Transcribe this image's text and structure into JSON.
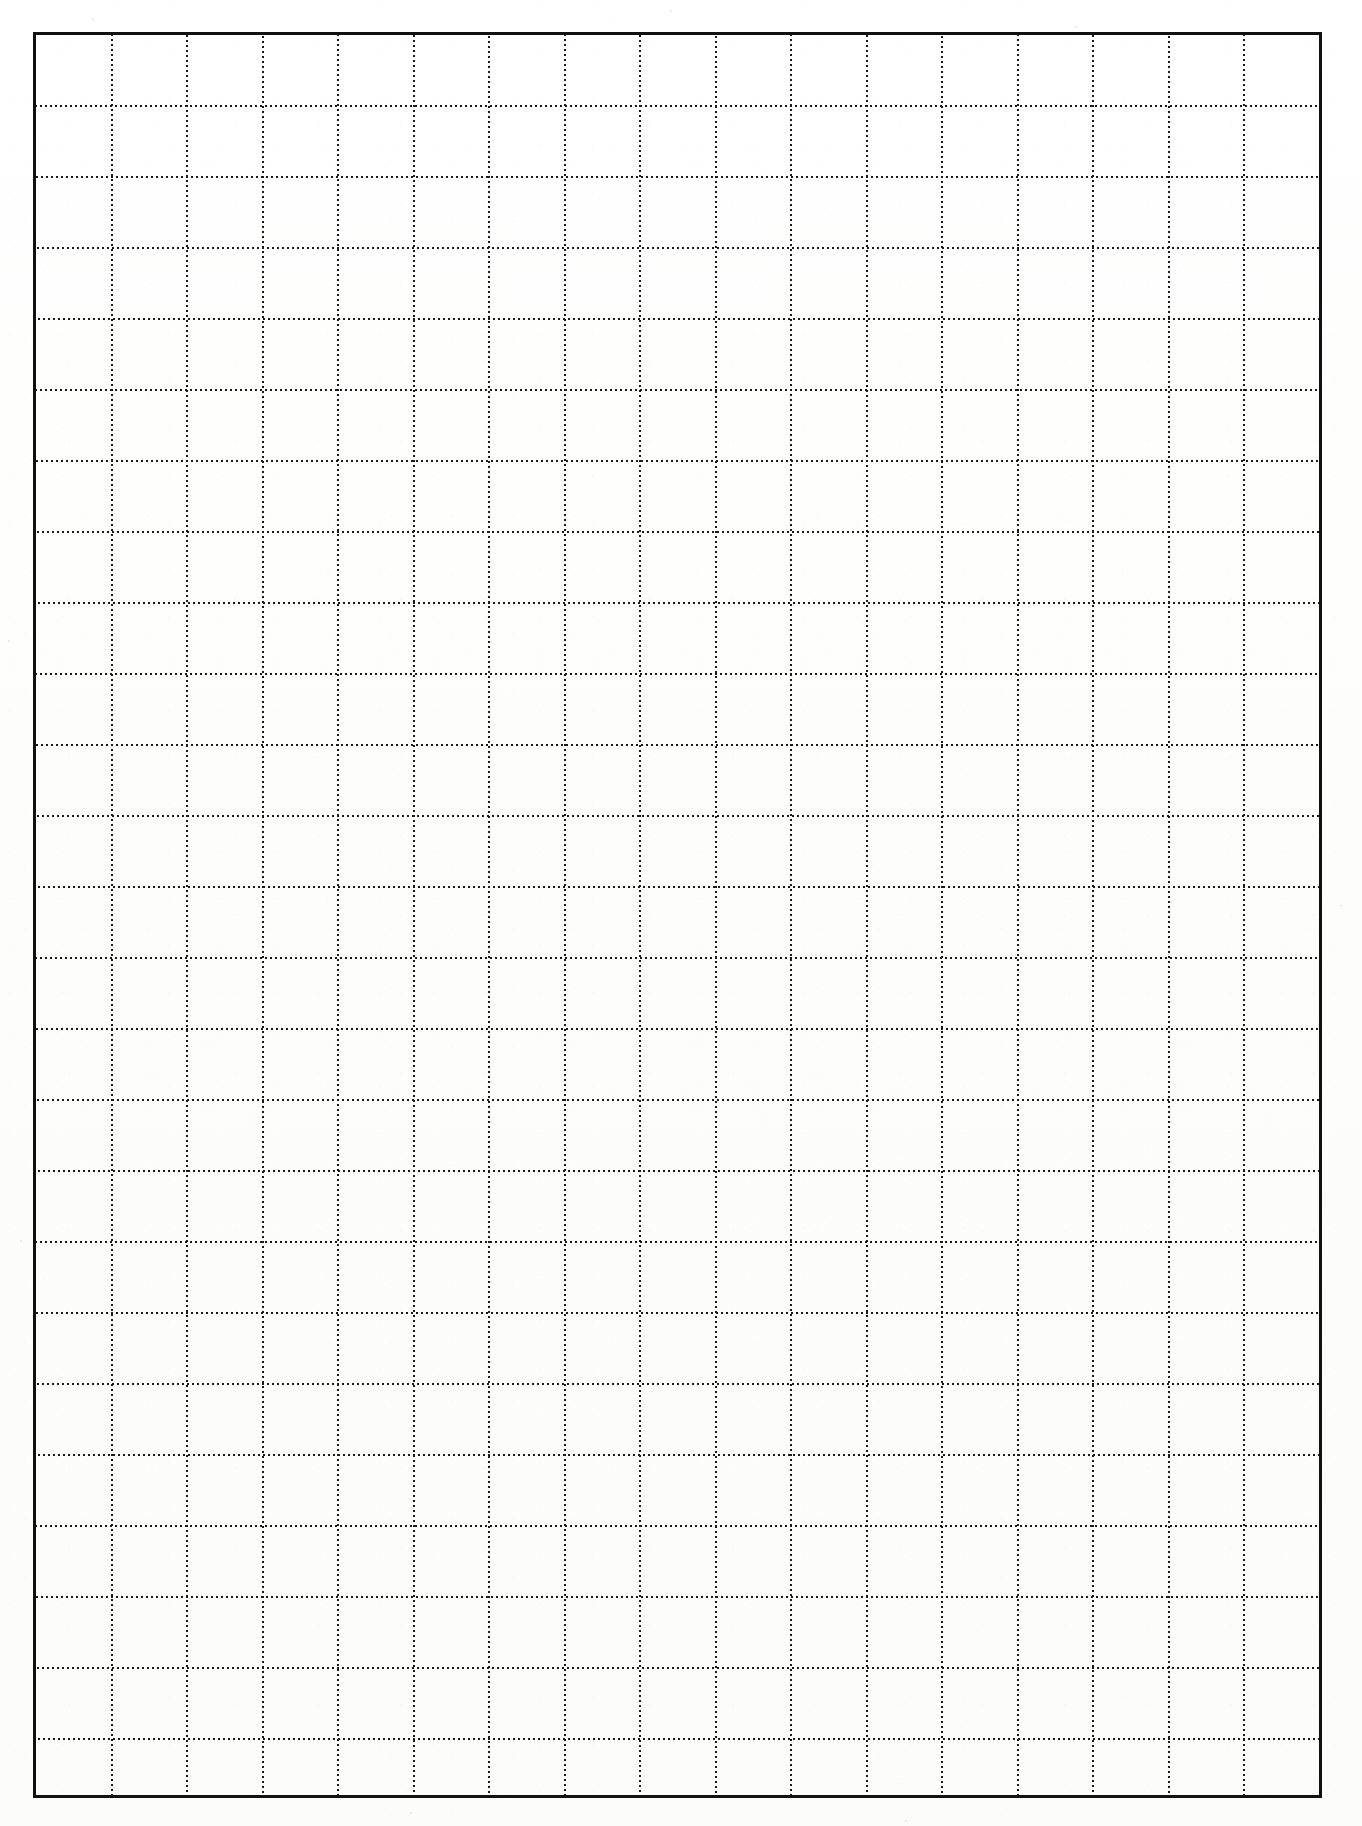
{
  "document": {
    "kind": "scanned-graph-paper",
    "page_width": 1362,
    "page_height": 1826,
    "background_color": "#fdfdfc",
    "caption": ""
  },
  "frame": {
    "name": "plot-border",
    "color": "#111111",
    "thickness_px": 3,
    "left": 33,
    "top": 32,
    "width": 1289,
    "height": 1766
  },
  "grid": {
    "style": "dotted",
    "dot_color": "#1a1a1a",
    "dot_size_px": 2,
    "dot_period_px": 5,
    "columns": 17,
    "rows": 25,
    "cell_width_px": 75.5,
    "cell_height_px": 71,
    "vertical_line_x": [
      75.5,
      151,
      226.5,
      302,
      377.5,
      453,
      528.5,
      604,
      679.5,
      755,
      830.5,
      906,
      981.5,
      1057,
      1132.5,
      1208
    ],
    "horizontal_line_y": [
      71,
      142,
      213,
      284,
      355,
      426,
      497,
      568,
      639,
      710,
      781,
      852,
      923,
      994,
      1065,
      1136,
      1207,
      1278,
      1349,
      1420,
      1491,
      1562,
      1633,
      1704
    ]
  },
  "specks": [
    {
      "x": 92,
      "y": 18,
      "r": 2
    },
    {
      "x": 670,
      "y": 10,
      "r": 2
    },
    {
      "x": 1075,
      "y": 26,
      "r": 2
    },
    {
      "x": 8,
      "y": 640,
      "r": 2
    },
    {
      "x": 1340,
      "y": 905,
      "r": 2
    },
    {
      "x": 410,
      "y": 1812,
      "r": 2
    },
    {
      "x": 905,
      "y": 1820,
      "r": 2
    },
    {
      "x": 20,
      "y": 1240,
      "r": 2
    }
  ]
}
